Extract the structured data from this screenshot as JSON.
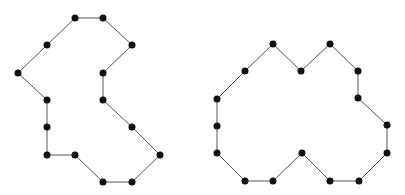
{
  "diagram": {
    "type": "polygon-lattice",
    "edge_color": "#555555",
    "vertex_color": "#111111",
    "vertex_radius": 3.5,
    "polygons": [
      {
        "name": "left-polygon",
        "vertices": [
          [
            75,
            18
          ],
          [
            103,
            18
          ],
          [
            132,
            45
          ],
          [
            103,
            73
          ],
          [
            103,
            100
          ],
          [
            132,
            127
          ],
          [
            160,
            155
          ],
          [
            132,
            182
          ],
          [
            103,
            182
          ],
          [
            75,
            155
          ],
          [
            47,
            155
          ],
          [
            47,
            127
          ],
          [
            47,
            100
          ],
          [
            18,
            73
          ],
          [
            47,
            45
          ]
        ]
      },
      {
        "name": "right-polygon",
        "vertices": [
          [
            273,
            44
          ],
          [
            301,
            71
          ],
          [
            330,
            44
          ],
          [
            358,
            71
          ],
          [
            358,
            98
          ],
          [
            387,
            125
          ],
          [
            387,
            153
          ],
          [
            359,
            181
          ],
          [
            330,
            181
          ],
          [
            302,
            153
          ],
          [
            273,
            181
          ],
          [
            245,
            181
          ],
          [
            217,
            153
          ],
          [
            217,
            126
          ],
          [
            217,
            99
          ],
          [
            245,
            71
          ]
        ]
      }
    ]
  }
}
